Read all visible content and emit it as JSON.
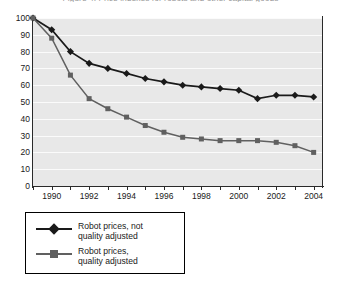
{
  "title": "Figure 4. Price indexes for robots and other capital goods",
  "chart_data": {
    "type": "line",
    "title": "Figure 4. Price indexes for robots and other capital goods",
    "xlabel": "",
    "ylabel": "",
    "x": [
      1989,
      1990,
      1991,
      1992,
      1993,
      1994,
      1995,
      1996,
      1997,
      1998,
      1999,
      2000,
      2001,
      2002,
      2003,
      2004
    ],
    "xlim": [
      1989,
      2004.5
    ],
    "ylim": [
      0,
      100
    ],
    "yticks": [
      0,
      10,
      20,
      30,
      40,
      50,
      60,
      70,
      80,
      90,
      100
    ],
    "xtick_labels": [
      "1990",
      "1992",
      "1994",
      "1996",
      "1998",
      "2000",
      "2002",
      "2004"
    ],
    "xtick_label_years": [
      1990,
      1992,
      1994,
      1996,
      1998,
      2000,
      2002,
      2004
    ],
    "grid": true,
    "legend_position": "below",
    "series": [
      {
        "name": "Robot prices, not quality adjusted",
        "marker": "diamond",
        "color": "#1a1a1a",
        "values": [
          100,
          93,
          80,
          73,
          70,
          67,
          64,
          62,
          60,
          59,
          58,
          57,
          52,
          54,
          54,
          53
        ]
      },
      {
        "name": "Robot prices, quality adjusted",
        "marker": "square",
        "color": "#606060",
        "values": [
          100,
          88,
          66,
          52,
          46,
          41,
          36,
          32,
          29,
          28,
          27,
          27,
          27,
          26,
          24,
          20
        ]
      }
    ]
  },
  "yaxis": {
    "ticks": [
      "100",
      "90",
      "80",
      "70",
      "60",
      "50",
      "40",
      "30",
      "20",
      "10",
      "0"
    ]
  },
  "legend": {
    "entries": [
      {
        "label": "Robot prices, not\nquality adjusted",
        "marker": "diamond",
        "color": "#1a1a1a"
      },
      {
        "label": "Robot prices,\nquality adjusted",
        "marker": "square",
        "color": "#606060"
      }
    ]
  }
}
